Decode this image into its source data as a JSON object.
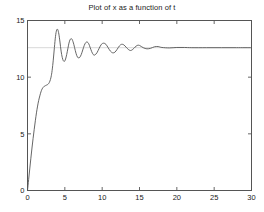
{
  "chart_data": {
    "type": "line",
    "title": "Plot of x as a function of t",
    "xlabel": "",
    "ylabel": "",
    "xlim": [
      0,
      30
    ],
    "ylim": [
      0,
      15
    ],
    "xticks": [
      0,
      5,
      10,
      15,
      20,
      25,
      30
    ],
    "yticks": [
      0,
      5,
      10,
      15
    ],
    "xtick_labels": [
      "0",
      "5",
      "10",
      "15",
      "20",
      "25",
      "30"
    ],
    "ytick_labels": [
      "0",
      "5",
      "10",
      "15"
    ],
    "grid": false,
    "legend": null,
    "line_color": "#555555",
    "axis_color": "#555555",
    "background_color": "#ffffff",
    "reference_line": {
      "orientation": "horizontal",
      "value": 12.6,
      "color": "#d8d8d8",
      "label": ""
    },
    "series": [
      {
        "name": "x(t)",
        "x": [
          0.0,
          0.15,
          0.3,
          0.45,
          0.6,
          0.75,
          0.9,
          1.05,
          1.2,
          1.35,
          1.5,
          1.65,
          1.8,
          1.95,
          2.1,
          2.25,
          2.4,
          2.55,
          2.7,
          2.85,
          3.0,
          3.15,
          3.3,
          3.45,
          3.6,
          3.75,
          3.9,
          4.05,
          4.2,
          4.35,
          4.5,
          4.65,
          4.8,
          4.95,
          5.1,
          5.25,
          5.4,
          5.55,
          5.7,
          5.85,
          6.0,
          6.2,
          6.4,
          6.6,
          6.8,
          7.0,
          7.2,
          7.4,
          7.6,
          7.8,
          8.0,
          8.2,
          8.4,
          8.6,
          8.8,
          9.0,
          9.3,
          9.6,
          9.9,
          10.2,
          10.5,
          10.8,
          11.1,
          11.4,
          11.7,
          12.0,
          12.3,
          12.6,
          12.9,
          13.2,
          13.5,
          13.8,
          14.1,
          14.4,
          14.7,
          15.0,
          15.5,
          16.0,
          16.5,
          17.0,
          17.5,
          18.0,
          19.0,
          20.0,
          21.0,
          22.0,
          24.0,
          26.0,
          28.0,
          30.0
        ],
        "y": [
          0.0,
          0.95,
          1.9,
          2.85,
          3.75,
          4.6,
          5.4,
          6.15,
          6.85,
          7.45,
          7.95,
          8.35,
          8.7,
          8.95,
          9.1,
          9.2,
          9.25,
          9.3,
          9.35,
          9.45,
          9.65,
          10.0,
          10.6,
          11.5,
          12.6,
          13.6,
          14.15,
          14.2,
          13.8,
          13.1,
          12.3,
          11.75,
          11.45,
          11.4,
          11.6,
          12.0,
          12.5,
          13.0,
          13.3,
          13.4,
          13.3,
          12.9,
          12.35,
          11.9,
          11.7,
          11.75,
          12.0,
          12.4,
          12.8,
          13.05,
          13.1,
          12.95,
          12.6,
          12.25,
          12.0,
          11.95,
          12.15,
          12.55,
          12.9,
          13.0,
          12.9,
          12.6,
          12.3,
          12.15,
          12.2,
          12.45,
          12.75,
          12.9,
          12.85,
          12.65,
          12.45,
          12.35,
          12.45,
          12.65,
          12.8,
          12.8,
          12.6,
          12.5,
          12.55,
          12.68,
          12.7,
          12.62,
          12.58,
          12.62,
          12.62,
          12.6,
          12.6,
          12.6,
          12.6,
          12.6
        ]
      }
    ]
  }
}
